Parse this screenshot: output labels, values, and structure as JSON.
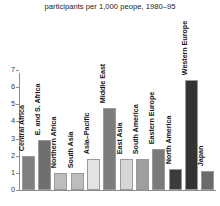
{
  "chart_data": {
    "type": "bar",
    "title": "participants per 1,000 peope, 1980–95",
    "xlabel": "",
    "ylabel": "",
    "ylim": [
      0,
      7
    ],
    "yticks": [
      0,
      1,
      2,
      3,
      4,
      5,
      6,
      7
    ],
    "ytick_labels": [
      "0",
      "1",
      "2",
      "3",
      "4",
      "5",
      "6",
      "7"
    ],
    "grid": false,
    "legend": "none",
    "categories": [
      "Central Africa",
      "E. and S. Africa",
      "Northern Africa",
      "South Asia",
      "Asia–Pacific",
      "Middle East",
      "East Asia",
      "South America",
      "Eastern Europe",
      "North America",
      "Western Europe",
      "Japan"
    ],
    "values": [
      2.0,
      2.9,
      1.0,
      1.0,
      1.8,
      4.8,
      1.8,
      1.8,
      2.4,
      1.2,
      6.4,
      1.1
    ],
    "bar_colors": [
      "#808080",
      "#6f6f6f",
      "#bdbdbd",
      "#bdbdbd",
      "#e3e3e3",
      "#7d7d7d",
      "#d6d6d6",
      "#9e9e9e",
      "#7a7a7a",
      "#3c3c3c",
      "#333333",
      "#6b6b6b"
    ],
    "axis_color": "#8d8d8d",
    "background_color": "#ffffff",
    "text_color": "#161616"
  }
}
